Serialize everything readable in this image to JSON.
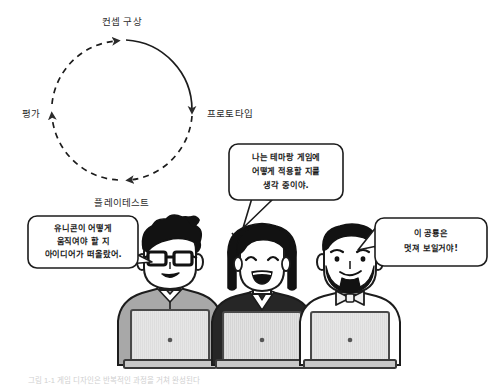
{
  "image": {
    "title": "게임 디자인 프로세스 다이어그램",
    "width": 496,
    "height": 385,
    "background_color": "#ffffff"
  },
  "cycle_diagram": {
    "name": "iterative-game-design-cycle",
    "center": {
      "x": 122,
      "y": 110
    },
    "radius": 70,
    "direction": "clockwise",
    "stroke_color": "#2b2b2b",
    "labels": [
      {
        "id": "concept",
        "text": "컨셉 구상",
        "position": "top",
        "x": 122,
        "y": 22
      },
      {
        "id": "prototype",
        "text": "프로토타입",
        "position": "right",
        "x": 208,
        "y": 114
      },
      {
        "id": "playtest",
        "text": "플레이테스트",
        "position": "bottom",
        "x": 122,
        "y": 203
      },
      {
        "id": "evaluation",
        "text": "평가",
        "position": "left",
        "x": 38,
        "y": 114
      }
    ],
    "segments": [
      {
        "from": "concept",
        "to": "prototype",
        "style": "solid"
      },
      {
        "from": "prototype",
        "to": "playtest",
        "style": "dashed"
      },
      {
        "from": "playtest",
        "to": "evaluation",
        "style": "dashed"
      },
      {
        "from": "evaluation",
        "to": "concept",
        "style": "dashed"
      }
    ]
  },
  "characters": [
    {
      "id": "person-left",
      "description": "안경 쓴 남성",
      "hair": "black-spiky",
      "glasses": true,
      "shirt_color": "#a8a8a8",
      "shirt_type": "polo",
      "laptop_color": "#d8d8d8"
    },
    {
      "id": "person-center",
      "description": "단발 여성",
      "hair": "black-bob",
      "glasses": false,
      "shirt_color": "#2a2a2a",
      "shirt_type": "v-neck",
      "laptop_color": "#d8d8d8"
    },
    {
      "id": "person-right",
      "description": "턱수염에 나비넥타이 남성",
      "hair": "black-short",
      "beard": true,
      "bowtie": true,
      "shirt_color": "#ffffff",
      "shirt_type": "shirt-with-bowtie",
      "laptop_color": "#d8d8d8"
    }
  ],
  "speech_bubbles": [
    {
      "id": "bubble-left",
      "speaker": "person-left",
      "lines": [
        "유니콘이 어떻게",
        "움직여야 할 지",
        "아이디어가 떠올랐어."
      ],
      "x": 28,
      "y": 216,
      "width": 110,
      "height": 52,
      "tail_direction": "right-down"
    },
    {
      "id": "bubble-center",
      "speaker": "person-center",
      "lines": [
        "나는 테마랑 게임에",
        "어떻게 적용할 지를",
        "생각 중이야."
      ],
      "x": 229,
      "y": 144,
      "width": 114,
      "height": 56,
      "tail_direction": "left-down"
    },
    {
      "id": "bubble-right",
      "speaker": "person-right",
      "lines": [
        "이 공룡은",
        "멋져 보일거야!"
      ],
      "x": 375,
      "y": 218,
      "width": 112,
      "height": 48,
      "tail_direction": "left-down"
    }
  ],
  "caption": {
    "text": "그림 1-1 게임 디자인은 반복적인 과정을 거쳐 완성된다",
    "visible": "partially-cropped",
    "x": 28,
    "y": 381
  }
}
